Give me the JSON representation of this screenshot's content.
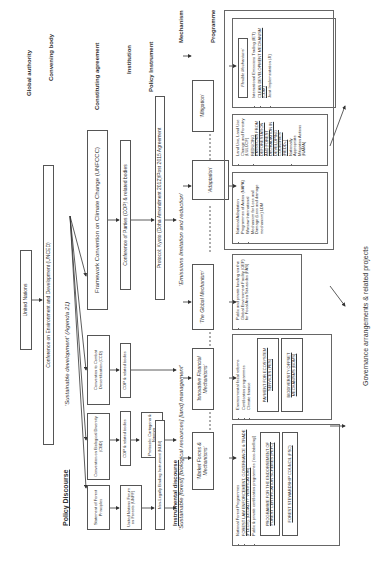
{
  "levels": {
    "global_authority": "Global authority",
    "convening_body": "Convening body",
    "constituting_agreement": "Constituting agreement",
    "institution": "Institution",
    "policy_instrument": "Policy Instrument",
    "mechanism": "Mechanism",
    "programme": "Programme"
  },
  "discourse": {
    "policy": "Policy Discourse",
    "instrumental": "Instrumental discourse"
  },
  "nodes": {
    "un": "United Nations",
    "unced": "Conference on Environment and Development (UNCED)",
    "agenda21": "'Sustainable development' (Agenda 21)",
    "unfccc": "Framework Convention on Climate Change (UNFCCC)",
    "ccd": "Convention to Combat Desertification (CCD)",
    "cbd": "Convention on Biological Diversity (CBD)",
    "forest_principles": "Statement of Forest Principles",
    "cop_unfccc": "Conference of Parties (COP) & related bodies",
    "cop_ccd": "COP & related bodies",
    "cop_cbd": "COP & related bodies",
    "unff": "United Nations Forum on Forests (UNFF)",
    "kyoto": "Protocol: Kyoto (Doha Amendment 2012)/Post 2015 Agreement",
    "cartagena": "Protocols: Cartagena & Nagoya",
    "nlbi": "Non-Legally Binding Instrument (NLBI)",
    "emissions": "'Emissions limitation and reduction'",
    "sustainable_forest": "'Sustainable [forest] [biological resources] [land] management'",
    "mitigation": "'Mitigation'",
    "adaptation": "'Adaptation'",
    "global_mechanism": "'The Global Mechanism'",
    "innovative_financial": "'Innovative Financial Mechanisms'",
    "market_forces": "'Market Forces & Mechanisms'",
    "governance": "Governance arrangements & related projects"
  },
  "programmes": {
    "flexible": {
      "title": "'Flexible Mechanisms'",
      "items": [
        "International Emissions Trading (IET)",
        "CLEAN DEVELOPMENT MECHANISM (CDM)",
        "Joint Implementation (JI)"
      ]
    },
    "mitigation": {
      "items": [
        "Land Use, Land Use Change and Forestry (LULUCF)",
        "REDUCING EMISSIONS FROM DEFORESTATION AND FOREST DEGRADATION IN DEVELOPING COUNTRIES (REDD+)",
        "Nationally Appropriate Mitigation Actions (NAMA)"
      ]
    },
    "adaptation": {
      "items": [
        "National Adaptation Programmes of Action (NAPA)",
        "Warsaw International Mechanism for Loss and Damage (Loss and damage mechanism) LDM"
      ]
    },
    "global_mechanism": {
      "items": [
        "Public and private funding via the Global Environment Facility (GEF) for Focal Area Set-asides (FAS)"
      ]
    },
    "innovative": {
      "items": [
        "Environmental fiscal reforms",
        "Certification programmes",
        "Climate finance"
      ],
      "pes": "PAYMENT FOR ECOSYSTEM SERVICES (PES)",
      "bom": "BIODIVERSITY OFFSET MECHANISMS (BOMs)"
    },
    "market": {
      "items": [
        "National Forest Programmes",
        "FOREST LAW ENFORCEMENT, GOVERNANCE & TRADE (FLEGT), (LEGALITY VERIFICATION)",
        "Public & private certification programmes ('eco-labelling')"
      ],
      "pefc": "PROGRAMME FOR THE ENDORSEMENT OF FOREST CERTIFICATION SCHEMES (PEFC)",
      "fsc": "FOREST STEWARDSHIP COUNCIL (FSC)"
    }
  }
}
